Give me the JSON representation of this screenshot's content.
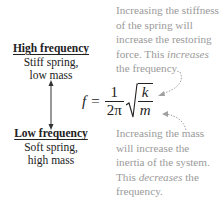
{
  "diagram": {
    "type": "annotated-formula",
    "high": {
      "title": "High frequency",
      "line1": "Stiff spring,",
      "line2": "low mass"
    },
    "low": {
      "title": "Low frequency",
      "line1": "Soft spring,",
      "line2": "high mass"
    },
    "formula": {
      "lhs": "f",
      "equals": "=",
      "frac_num": "1",
      "frac_den": "2π",
      "sqrt_num": "k",
      "sqrt_den": "m"
    },
    "note_top": {
      "line1": "Increasing the stiffness",
      "line2": "of the spring will",
      "line3": "increase the restoring",
      "line4_pre": "force. This ",
      "line4_em": "increases",
      "line5": "the frequency."
    },
    "note_bottom": {
      "line1": "Increasing the mass",
      "line2": "will increase the",
      "line3": "inertia of the system.",
      "line4_pre": "This ",
      "line4_em": "decreases",
      "line4_post": " the",
      "line5": "frequency."
    },
    "colors": {
      "text": "#222222",
      "note": "#9a9a9a",
      "arrow": "#333333",
      "note_arrow": "#a0a0a0"
    }
  }
}
